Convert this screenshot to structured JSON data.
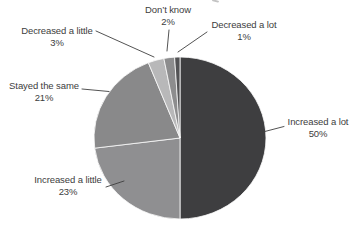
{
  "chart_data": {
    "type": "pie",
    "start_angle_deg": 0,
    "direction": "clockwise",
    "label_style": "outside-with-leader-lines",
    "legend": "none",
    "background_color": "#ffffff",
    "label_text_color": "#3d3d3d",
    "divider_color": "#fbfbfb",
    "leader_line_color": "#3f3f3f",
    "slices": [
      {
        "label": "Increased a lot",
        "value": 50,
        "pct": "50%",
        "color": "#3e3e40"
      },
      {
        "label": "Increased a little",
        "value": 23,
        "pct": "23%",
        "color": "#8f8f91"
      },
      {
        "label": "Stayed the same",
        "value": 21,
        "pct": "21%",
        "color": "#89898a"
      },
      {
        "label": "Decreased a little",
        "value": 3,
        "pct": "3%",
        "color": "#b8b8b9"
      },
      {
        "label": "Don’t know",
        "value": 2,
        "pct": "2%",
        "color": "#8d8d8e"
      },
      {
        "label": "Decreased a lot",
        "value": 1,
        "pct": "1%",
        "color": "#535355"
      }
    ]
  }
}
